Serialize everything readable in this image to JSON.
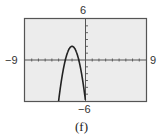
{
  "chart_data": {
    "type": "line",
    "title": "",
    "caption": "(f)",
    "xlabel": "",
    "ylabel": "",
    "xlim": [
      -9,
      9
    ],
    "ylim": [
      -6,
      6
    ],
    "x_tick_step": 1,
    "y_tick_step": 1,
    "grid": false,
    "window_labels": {
      "xmin": "−9",
      "xmax": "9",
      "ymin": "−6",
      "ymax": "6"
    },
    "series": [
      {
        "name": "y = -2(x+2)^2 + 2",
        "function": "-2*(x+2)^2+2",
        "vertex": [
          -2,
          2
        ],
        "roots": [
          -3,
          -1
        ],
        "x": [
          -3.8,
          -3.5,
          -3,
          -2.5,
          -2,
          -1.5,
          -1,
          -0.5,
          0
        ],
        "y": [
          -4.48,
          -2.5,
          0,
          1.5,
          2,
          1.5,
          0,
          -2.5,
          -6
        ]
      }
    ],
    "colors": {
      "plot_bg": "#ececec",
      "frame": "#555555",
      "curve": "#222222",
      "axes": "#555555"
    }
  }
}
